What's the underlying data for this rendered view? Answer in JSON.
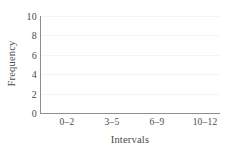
{
  "chart_data": {
    "type": "bar",
    "title": "",
    "subtitle": "",
    "xlabel": "Intervals",
    "ylabel": "Frequency",
    "categories": [
      "0–2",
      "3–5",
      "6–9",
      "10–12"
    ],
    "values": [
      0,
      0,
      0,
      0
    ],
    "series": [
      {
        "name": "Frequency",
        "values": [
          0,
          0,
          0,
          0
        ]
      }
    ],
    "ylim": [
      0,
      10
    ],
    "y_ticks": [
      0,
      2,
      4,
      6,
      8,
      10
    ],
    "y_tick_labels": [
      "0",
      "2",
      "4",
      "6",
      "8",
      "10"
    ],
    "x_tick_labels": [
      "0–2",
      "3–5",
      "6–9",
      "10–12"
    ],
    "grid": true,
    "grid_axis": "y",
    "legend": false,
    "legend_position": "none",
    "annotations": [],
    "colors": {
      "axis": "#8e8e93",
      "grid": "#f4f4f6",
      "text": "#4a4a4a",
      "background": "#ffffff",
      "bar": "#9aa7b8"
    }
  }
}
